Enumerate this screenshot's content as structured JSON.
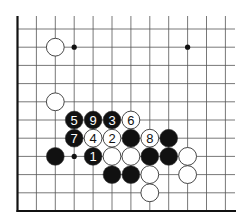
{
  "diagram": {
    "type": "go-board-diagram",
    "grid": {
      "columns": 12,
      "rows": 11,
      "origin_x": 17.5,
      "origin_y": 29,
      "col_spacing": 18.9,
      "row_spacing": 18.2,
      "line_top": 16,
      "line_right": 235,
      "left_edge": true,
      "bottom_edge": true
    },
    "colors": {
      "line": "#555555",
      "edge": "#111111",
      "black_stone": "#111111",
      "white_stone": "#ffffff",
      "stone_outline": "#333333",
      "hoshi": "#111111"
    },
    "hoshi": [
      {
        "col": 3,
        "row": 1
      },
      {
        "col": 9,
        "row": 1
      },
      {
        "col": 3,
        "row": 7
      }
    ],
    "stones": [
      {
        "col": 2,
        "row": 1,
        "color": "white",
        "label": ""
      },
      {
        "col": 2,
        "row": 4,
        "color": "white",
        "label": ""
      },
      {
        "col": 3,
        "row": 5,
        "color": "black",
        "label": "5"
      },
      {
        "col": 4,
        "row": 5,
        "color": "black",
        "label": "9"
      },
      {
        "col": 5,
        "row": 5,
        "color": "black",
        "label": "3"
      },
      {
        "col": 6,
        "row": 5,
        "color": "white",
        "label": "6"
      },
      {
        "col": 3,
        "row": 6,
        "color": "black",
        "label": "7"
      },
      {
        "col": 4,
        "row": 6,
        "color": "white",
        "label": "4"
      },
      {
        "col": 5,
        "row": 6,
        "color": "white",
        "label": "2"
      },
      {
        "col": 6,
        "row": 6,
        "color": "black",
        "label": ""
      },
      {
        "col": 7,
        "row": 6,
        "color": "white",
        "label": "8"
      },
      {
        "col": 8,
        "row": 6,
        "color": "black",
        "label": ""
      },
      {
        "col": 2,
        "row": 7,
        "color": "black",
        "label": ""
      },
      {
        "col": 4,
        "row": 7,
        "color": "black",
        "label": "1"
      },
      {
        "col": 5,
        "row": 7,
        "color": "white",
        "label": ""
      },
      {
        "col": 6,
        "row": 7,
        "color": "white",
        "label": ""
      },
      {
        "col": 7,
        "row": 7,
        "color": "black",
        "label": ""
      },
      {
        "col": 8,
        "row": 7,
        "color": "black",
        "label": ""
      },
      {
        "col": 9,
        "row": 7,
        "color": "white",
        "label": ""
      },
      {
        "col": 5,
        "row": 8,
        "color": "black",
        "label": ""
      },
      {
        "col": 6,
        "row": 8,
        "color": "black",
        "label": ""
      },
      {
        "col": 7,
        "row": 8,
        "color": "white",
        "label": ""
      },
      {
        "col": 9,
        "row": 8,
        "color": "white",
        "label": ""
      },
      {
        "col": 7,
        "row": 9,
        "color": "white",
        "label": ""
      }
    ]
  }
}
